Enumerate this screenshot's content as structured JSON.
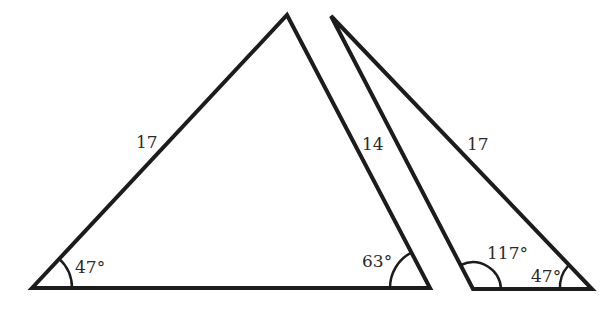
{
  "triangles": [
    {
      "id": "left",
      "vertices": {
        "bottom_left": [
          32,
          288
        ],
        "apex": [
          287,
          15
        ],
        "bottom_right": [
          430,
          288
        ]
      },
      "side_labels": {
        "left_side": "17",
        "right_side": "14"
      },
      "angle_labels": {
        "bottom_left": "47°",
        "bottom_right": "63°"
      }
    },
    {
      "id": "right",
      "vertices": {
        "apex": [
          331,
          16
        ],
        "bottom_left": [
          473,
          289
        ],
        "bottom_right": [
          592,
          289
        ]
      },
      "side_labels": {
        "right_side": "17"
      },
      "angle_labels": {
        "bottom_left": "117°",
        "bottom_right": "47°"
      }
    }
  ],
  "colors": {
    "stroke": "#1c1c1c",
    "text": "#2a2a2a",
    "background": "#ffffff"
  }
}
